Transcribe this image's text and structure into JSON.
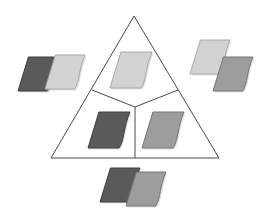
{
  "figure": {
    "background_color": "#ffffff",
    "width": 266,
    "height": 210
  },
  "palette": {
    "dark_gray": "#5a5a5a",
    "dark_gray_edge": "#3f3f3f",
    "medium_gray": "#9d9d9d",
    "medium_gray_edge": "#767676",
    "light_gray": "#d3d3d3",
    "light_gray_edge": "#a9a9a9",
    "outline": "#4a4a4a",
    "white": "#ffffff"
  },
  "triangle": {
    "name": "outer-triangle",
    "apex": {
      "x": 134,
      "y": 16
    },
    "bottom_left": {
      "x": 51,
      "y": 158
    },
    "bottom_right": {
      "x": 219,
      "y": 158
    },
    "stroke": "#4a4a4a",
    "stroke_width": 1,
    "fill": "#ffffff"
  },
  "divider": {
    "name": "y-divider",
    "center": {
      "x": 135,
      "y": 107
    },
    "left_arm_end": {
      "x": 92,
      "y": 90
    },
    "right_arm_end": {
      "x": 178,
      "y": 90
    },
    "stem_end": {
      "x": 135,
      "y": 158
    },
    "stroke": "#4a4a4a",
    "stroke_width": 1
  },
  "inner_cards": [
    {
      "name": "inner-card-top",
      "region": "top-sector",
      "tone": "light",
      "fill": "#d3d3d3",
      "x": 110,
      "y": 52,
      "width": 42,
      "height": 36
    },
    {
      "name": "inner-card-bottom-left",
      "region": "bottom-left-sector",
      "tone": "dark",
      "fill": "#5a5a5a",
      "x": 88,
      "y": 112,
      "width": 42,
      "height": 36
    },
    {
      "name": "inner-card-bottom-right",
      "region": "bottom-right-sector",
      "tone": "medium",
      "fill": "#9d9d9d",
      "x": 142,
      "y": 112,
      "width": 42,
      "height": 36
    }
  ],
  "outer_pairs": [
    {
      "name": "outer-pair-left",
      "position": "left",
      "cards": [
        {
          "name": "left-pair-back-card",
          "tone": "dark",
          "fill": "#5a5a5a",
          "x": 18,
          "y": 57,
          "width": 40,
          "height": 34
        },
        {
          "name": "left-pair-front-card",
          "tone": "light",
          "fill": "#d3d3d3",
          "x": 45,
          "y": 55,
          "width": 40,
          "height": 34
        }
      ]
    },
    {
      "name": "outer-pair-right",
      "position": "right",
      "cards": [
        {
          "name": "right-pair-upper-card",
          "tone": "light",
          "fill": "#d3d3d3",
          "x": 190,
          "y": 40,
          "width": 40,
          "height": 34
        },
        {
          "name": "right-pair-lower-card",
          "tone": "medium",
          "fill": "#9d9d9d",
          "x": 213,
          "y": 57,
          "width": 40,
          "height": 34
        }
      ]
    },
    {
      "name": "outer-pair-bottom",
      "position": "bottom",
      "cards": [
        {
          "name": "bottom-pair-left-card",
          "tone": "dark",
          "fill": "#5a5a5a",
          "x": 100,
          "y": 168,
          "width": 40,
          "height": 34
        },
        {
          "name": "bottom-pair-right-card",
          "tone": "medium",
          "fill": "#9d9d9d",
          "x": 126,
          "y": 172,
          "width": 40,
          "height": 34
        }
      ]
    }
  ]
}
